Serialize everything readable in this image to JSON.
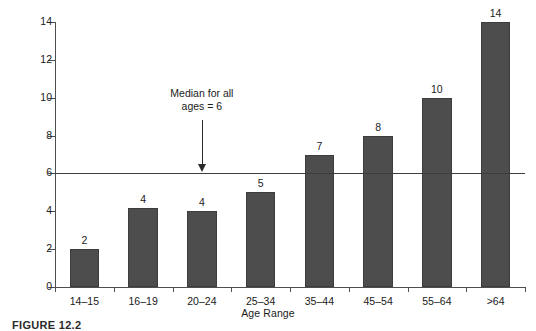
{
  "figure": {
    "caption": "FIGURE 12.2"
  },
  "chart_data": {
    "type": "bar",
    "title": "",
    "xlabel": "Age Range",
    "ylabel": "Median Days Away From Work",
    "categories": [
      "14–15",
      "16–19",
      "20–24",
      "25–34",
      "35–44",
      "45–54",
      "55–64",
      ">64"
    ],
    "values": [
      2,
      4,
      4,
      5,
      7,
      8,
      10,
      14
    ],
    "drawn_values": [
      2,
      4.2,
      4,
      5,
      7,
      8,
      10,
      14
    ],
    "value_labels": [
      "2",
      "4",
      "4",
      "5",
      "7",
      "8",
      "10",
      "14"
    ],
    "ylim": [
      0,
      14
    ],
    "ytick_labels": [
      "0",
      "2",
      "4",
      "6",
      "8",
      "10",
      "12",
      "14"
    ],
    "ytick_values": [
      0,
      2,
      4,
      6,
      8,
      10,
      12,
      14
    ],
    "grid": false,
    "legend": "none",
    "bar_color": "#4d4d4d",
    "axis_color": "#4f4f4f",
    "reference_line": {
      "value": 6,
      "color": "#3d3d3d",
      "label_line1": "Median for all",
      "label_line2": "ages = 6"
    }
  }
}
